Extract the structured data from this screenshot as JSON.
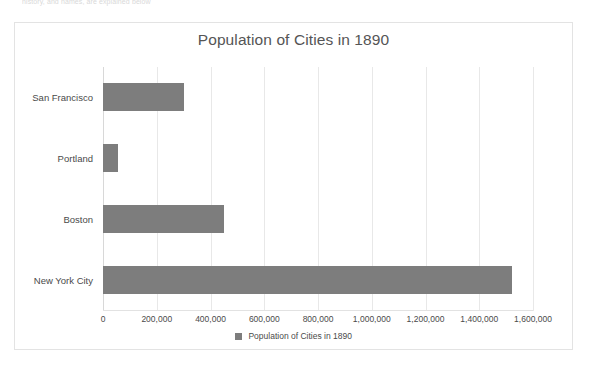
{
  "page": {
    "top_cutoff_text": "history, and names, are explained below"
  },
  "chart": {
    "title": "Population of Cities in 1890",
    "legend_label": "Population of Cities in 1890",
    "legend_swatch_name": "legend-color-swatch",
    "bar_color": "#7d7d7d",
    "gridline_color": "#e8e8e8",
    "border_color": "#e3e3e3"
  },
  "chart_data": {
    "type": "bar",
    "orientation": "horizontal",
    "title": "Population of Cities in 1890",
    "xlabel": "",
    "ylabel": "",
    "categories": [
      "San Francisco",
      "Portland",
      "Boston",
      "New York City"
    ],
    "values": [
      300000,
      57000,
      450000,
      1520000
    ],
    "series": [
      {
        "name": "Population of Cities in 1890",
        "values": [
          300000,
          57000,
          450000,
          1520000
        ]
      }
    ],
    "xlim": [
      0,
      1600000
    ],
    "xticks": [
      0,
      200000,
      400000,
      600000,
      800000,
      1000000,
      1200000,
      1400000,
      1600000
    ],
    "xticklabels": [
      "0",
      "200,000",
      "400,000",
      "600,000",
      "800,000",
      "1,000,000",
      "1,200,000",
      "1,400,000",
      "1,600,000"
    ],
    "grid": true,
    "grid_axis": "x",
    "legend": true,
    "legend_position": "bottom",
    "legend_entries": [
      "Population of Cities in 1890"
    ]
  }
}
